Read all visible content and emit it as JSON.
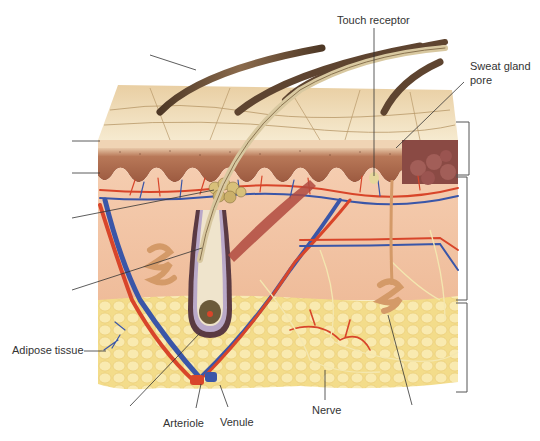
{
  "figure": {
    "labels": {
      "touch_receptor": "Touch receptor",
      "sweat_gland_pore_line1": "Sweat gland",
      "sweat_gland_pore_line2": "pore",
      "adipose_tissue": "Adipose tissue",
      "arteriole": "Arteriole",
      "venule": "Venule",
      "nerve": "Nerve"
    },
    "unlabeled_leader_lines": [
      "hair-shaft",
      "stratum-corneum",
      "epidermis-dermis-boundary",
      "sebaceous-gland",
      "hair-follicle",
      "hair-bulb",
      "sweat-gland-coil"
    ],
    "brackets": [
      "epidermis",
      "dermis",
      "hypodermis"
    ],
    "colors": {
      "surface": "#efdcb8",
      "epidermis": "#a8644a",
      "dermis": "#f2c3a2",
      "adipose": "#f3dc8a",
      "artery": "#d8452a",
      "vein": "#3a56a8",
      "nerve": "#f4e7b0",
      "hair": "#6b5038",
      "leader_line": "#333333"
    }
  }
}
